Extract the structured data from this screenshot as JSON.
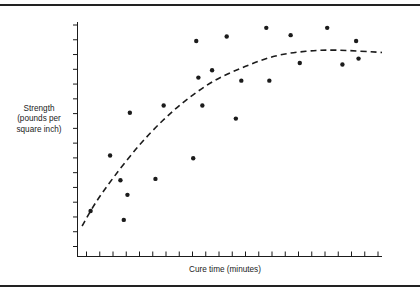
{
  "figure": {
    "background_color": "#ffffff",
    "ink_color": "#1b1b1b",
    "frame_color": "#222222"
  },
  "axes": {
    "y_label": "Strength\n(pounds per\nsquare inch)",
    "x_label": "Cure time (minutes)",
    "y_tick_count": 16,
    "x_tick_count": 23,
    "tick_labels_shown": "none"
  },
  "chart_data": {
    "type": "scatter",
    "title": "",
    "xlabel": "Cure time (minutes)",
    "ylabel": "Strength (pounds per square inch)",
    "xlim": [
      0,
      100
    ],
    "ylim": [
      0,
      100
    ],
    "grid": false,
    "legend": "none",
    "x_tick_labels": [],
    "y_tick_labels": [],
    "points": [
      {
        "x": 4.3,
        "y": 19.4
      },
      {
        "x": 10.7,
        "y": 43.1
      },
      {
        "x": 14.1,
        "y": 32.5
      },
      {
        "x": 15.2,
        "y": 15.6
      },
      {
        "x": 16.4,
        "y": 26.3
      },
      {
        "x": 17.2,
        "y": 61.3
      },
      {
        "x": 25.6,
        "y": 33.1
      },
      {
        "x": 28.3,
        "y": 64.4
      },
      {
        "x": 38.0,
        "y": 41.9
      },
      {
        "x": 39.0,
        "y": 91.9
      },
      {
        "x": 39.7,
        "y": 76.3
      },
      {
        "x": 41.0,
        "y": 64.4
      },
      {
        "x": 44.2,
        "y": 79.4
      },
      {
        "x": 49.0,
        "y": 93.8
      },
      {
        "x": 52.0,
        "y": 58.8
      },
      {
        "x": 53.8,
        "y": 75.0
      },
      {
        "x": 62.0,
        "y": 97.5
      },
      {
        "x": 63.0,
        "y": 75.0
      },
      {
        "x": 70.0,
        "y": 94.4
      },
      {
        "x": 73.0,
        "y": 82.5
      },
      {
        "x": 82.0,
        "y": 97.5
      },
      {
        "x": 87.0,
        "y": 81.9
      },
      {
        "x": 91.5,
        "y": 91.9
      },
      {
        "x": 92.3,
        "y": 84.4
      }
    ],
    "trend_curve": {
      "style": "dashed",
      "description": "rising concave curve flattening to a plateau",
      "points": [
        {
          "x": 1.5,
          "y": 13.0
        },
        {
          "x": 6.0,
          "y": 23.0
        },
        {
          "x": 12.0,
          "y": 34.0
        },
        {
          "x": 20.0,
          "y": 47.0
        },
        {
          "x": 28.0,
          "y": 58.0
        },
        {
          "x": 36.0,
          "y": 67.0
        },
        {
          "x": 45.0,
          "y": 75.0
        },
        {
          "x": 55.0,
          "y": 81.0
        },
        {
          "x": 65.0,
          "y": 85.5
        },
        {
          "x": 75.0,
          "y": 87.5
        },
        {
          "x": 85.0,
          "y": 88.0
        },
        {
          "x": 100.0,
          "y": 87.0
        }
      ]
    }
  }
}
